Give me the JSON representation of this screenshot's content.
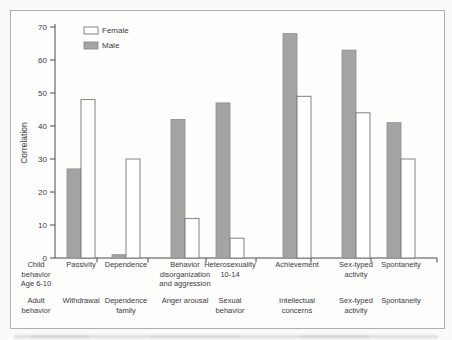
{
  "figure": {
    "background": "#fdfdfc",
    "page_background": "#fafaf8",
    "border_color": "#aeaeae",
    "axis_color": "#4a4a4a",
    "text_color": "#3c3c3c"
  },
  "chart_data": {
    "type": "bar",
    "title": "",
    "xlabel": "",
    "ylabel": "Correlation",
    "ylim": [
      0,
      70
    ],
    "yticks": [
      0,
      10,
      20,
      30,
      40,
      50,
      60,
      70
    ],
    "grid": false,
    "legend_position": "top-left",
    "legend_order": [
      "Female",
      "Male"
    ],
    "series": [
      {
        "name": "Male",
        "fill": "#a4a4a4",
        "stroke": "#8d8d8d",
        "values": [
          27,
          1,
          42,
          47,
          68,
          63,
          41
        ]
      },
      {
        "name": "Female",
        "fill": "#ffffff",
        "stroke": "#777777",
        "values": [
          48,
          30,
          12,
          6,
          49,
          44,
          30
        ]
      }
    ],
    "row_headers": {
      "child": {
        "text": "Child behavior Age 6-10",
        "lines": [
          "Child",
          "behavior",
          "Age 6-10"
        ]
      },
      "adult": {
        "text": "Adult behavior",
        "lines": [
          "Adult",
          "behavior"
        ]
      }
    },
    "categories": [
      {
        "child": {
          "text": "Passivity",
          "lines": [
            "Passivity"
          ]
        },
        "adult": {
          "text": "Withdrawal",
          "lines": [
            "Withdrawal"
          ]
        }
      },
      {
        "child": {
          "text": "Dependence",
          "lines": [
            "Dependence"
          ]
        },
        "adult": {
          "text": "Dependence family",
          "lines": [
            "Dependence",
            "family"
          ]
        }
      },
      {
        "child": {
          "text": "Behavior disorganization and aggression",
          "lines": [
            "Behavior",
            "disorganization",
            "and aggression"
          ]
        },
        "adult": {
          "text": "Anger arousal",
          "lines": [
            "Anger arousal"
          ]
        }
      },
      {
        "child": {
          "text": "Heterosexuality 10-14",
          "lines": [
            "Heterosexuality",
            "10-14"
          ]
        },
        "adult": {
          "text": "Sexual behavior",
          "lines": [
            "Sexual",
            "behavior"
          ]
        }
      },
      {
        "child": {
          "text": "Achievement",
          "lines": [
            "Achievement"
          ]
        },
        "adult": {
          "text": "Intellectual concerns",
          "lines": [
            "Intellectual",
            "concerns"
          ]
        }
      },
      {
        "child": {
          "text": "Sex-typed activity",
          "lines": [
            "Sex-typed",
            "activity"
          ]
        },
        "adult": {
          "text": "Sex-typed activity",
          "lines": [
            "Sex-typed",
            "activity"
          ]
        }
      },
      {
        "child": {
          "text": "Spontaneity",
          "lines": [
            "Spontaneity"
          ]
        },
        "adult": {
          "text": "Spontaneity",
          "lines": [
            "Spontaneity"
          ]
        }
      }
    ]
  }
}
